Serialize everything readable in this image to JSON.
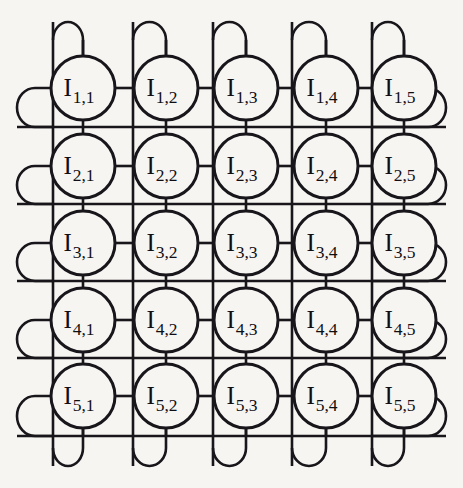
{
  "figure": {
    "kind": "network-topology-diagram",
    "topology_name": "torus",
    "rows": 5,
    "cols": 5,
    "node_prefix": "I",
    "background_color": "#f7f5f2",
    "line_color": "#18161a",
    "node_fill_color": "#f7f5f2"
  },
  "geometry": {
    "width": 463,
    "height": 488,
    "node_radius": 32,
    "node_centers_x": [
      83,
      166,
      246,
      326,
      404
    ],
    "node_centers_y": [
      88,
      166,
      243,
      320,
      396
    ],
    "column_line_x": [
      53,
      133,
      213,
      292,
      372
    ],
    "row_line_y": [
      127,
      204,
      281,
      358,
      436
    ],
    "top_loop_y": 22,
    "bottom_loop_y": 466,
    "left_loop_x": 17,
    "right_loop_x": 446,
    "loop_half_width": 18,
    "loop_half_height": 18
  },
  "nodes": [
    {
      "row": 1,
      "col": 1,
      "base": "I",
      "subscript": "1,1",
      "label": "I1,1",
      "cx": 83,
      "cy": 88
    },
    {
      "row": 1,
      "col": 2,
      "base": "I",
      "subscript": "1,2",
      "label": "I1,2",
      "cx": 166,
      "cy": 88
    },
    {
      "row": 1,
      "col": 3,
      "base": "I",
      "subscript": "1,3",
      "label": "I1,3",
      "cx": 246,
      "cy": 88
    },
    {
      "row": 1,
      "col": 4,
      "base": "I",
      "subscript": "1,4",
      "label": "I1,4",
      "cx": 326,
      "cy": 88
    },
    {
      "row": 1,
      "col": 5,
      "base": "I",
      "subscript": "1,5",
      "label": "I1,5",
      "cx": 404,
      "cy": 88
    },
    {
      "row": 2,
      "col": 1,
      "base": "I",
      "subscript": "2,1",
      "label": "I2,1",
      "cx": 83,
      "cy": 166
    },
    {
      "row": 2,
      "col": 2,
      "base": "I",
      "subscript": "2,2",
      "label": "I2,2",
      "cx": 166,
      "cy": 166
    },
    {
      "row": 2,
      "col": 3,
      "base": "I",
      "subscript": "2,3",
      "label": "I2,3",
      "cx": 246,
      "cy": 166
    },
    {
      "row": 2,
      "col": 4,
      "base": "I",
      "subscript": "2,4",
      "label": "I2,4",
      "cx": 326,
      "cy": 166
    },
    {
      "row": 2,
      "col": 5,
      "base": "I",
      "subscript": "2,5",
      "label": "I2,5",
      "cx": 404,
      "cy": 166
    },
    {
      "row": 3,
      "col": 1,
      "base": "I",
      "subscript": "3,1",
      "label": "I3,1",
      "cx": 83,
      "cy": 243
    },
    {
      "row": 3,
      "col": 2,
      "base": "I",
      "subscript": "3,2",
      "label": "I3,2",
      "cx": 166,
      "cy": 243
    },
    {
      "row": 3,
      "col": 3,
      "base": "I",
      "subscript": "3,3",
      "label": "I3,3",
      "cx": 246,
      "cy": 243
    },
    {
      "row": 3,
      "col": 4,
      "base": "I",
      "subscript": "3,4",
      "label": "I3,4",
      "cx": 326,
      "cy": 243
    },
    {
      "row": 3,
      "col": 5,
      "base": "I",
      "subscript": "3,5",
      "label": "I3,5",
      "cx": 404,
      "cy": 243
    },
    {
      "row": 4,
      "col": 1,
      "base": "I",
      "subscript": "4,1",
      "label": "I4,1",
      "cx": 83,
      "cy": 320
    },
    {
      "row": 4,
      "col": 2,
      "base": "I",
      "subscript": "4,2",
      "label": "I4,2",
      "cx": 166,
      "cy": 320
    },
    {
      "row": 4,
      "col": 3,
      "base": "I",
      "subscript": "4,3",
      "label": "I4,3",
      "cx": 246,
      "cy": 320
    },
    {
      "row": 4,
      "col": 4,
      "base": "I",
      "subscript": "4,4",
      "label": "I4,4",
      "cx": 326,
      "cy": 320
    },
    {
      "row": 4,
      "col": 5,
      "base": "I",
      "subscript": "4,5",
      "label": "I4,5",
      "cx": 404,
      "cy": 320
    },
    {
      "row": 5,
      "col": 1,
      "base": "I",
      "subscript": "5,1",
      "label": "I5,1",
      "cx": 83,
      "cy": 396
    },
    {
      "row": 5,
      "col": 2,
      "base": "I",
      "subscript": "5,2",
      "label": "I5,2",
      "cx": 166,
      "cy": 396
    },
    {
      "row": 5,
      "col": 3,
      "base": "I",
      "subscript": "5,3",
      "label": "I5,3",
      "cx": 246,
      "cy": 396
    },
    {
      "row": 5,
      "col": 4,
      "base": "I",
      "subscript": "5,4",
      "label": "I5,4",
      "cx": 326,
      "cy": 396
    },
    {
      "row": 5,
      "col": 5,
      "base": "I",
      "subscript": "5,5",
      "label": "I5,5",
      "cx": 404,
      "cy": 396
    }
  ],
  "wrap_loops": {
    "top_count": 5,
    "bottom_count": 5,
    "left_count": 5,
    "right_count": 5
  }
}
